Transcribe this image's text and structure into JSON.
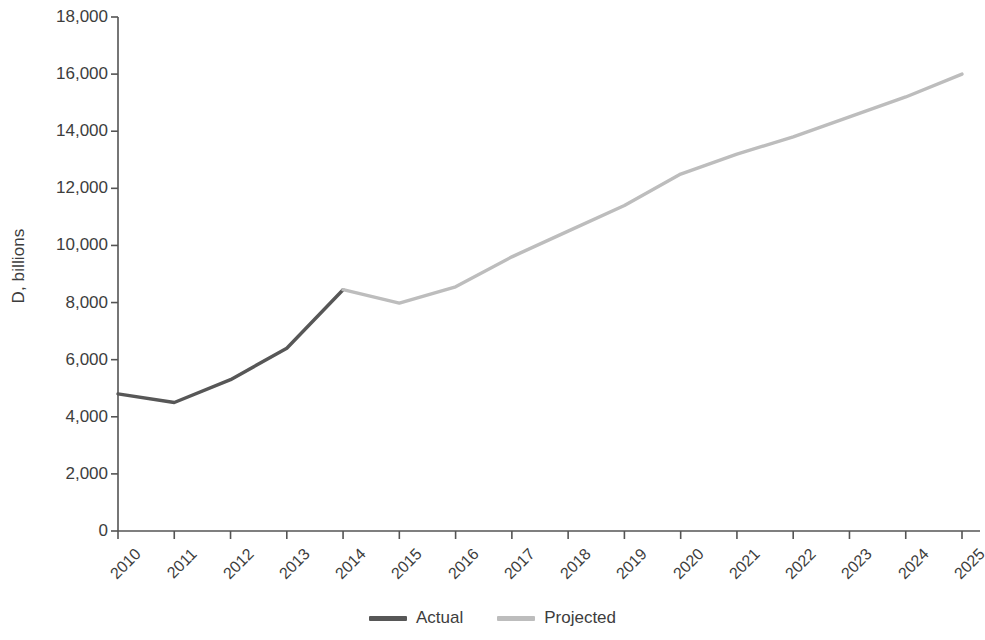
{
  "chart_data": {
    "type": "line",
    "title": "",
    "xlabel": "",
    "ylabel": "D, billions",
    "ylim": [
      0,
      18000
    ],
    "ytick_values": [
      0,
      2000,
      4000,
      6000,
      8000,
      10000,
      12000,
      14000,
      16000,
      18000
    ],
    "ytick_labels": [
      "0",
      "2,000",
      "4,000",
      "6,000",
      "8,000",
      "10,000",
      "12,000",
      "14,000",
      "16,000",
      "18,000"
    ],
    "grid": false,
    "legend_position": "bottom-center",
    "x": [
      2010,
      2011,
      2012,
      2013,
      2014,
      2015,
      2016,
      2017,
      2018,
      2019,
      2020,
      2021,
      2022,
      2023,
      2024,
      2025
    ],
    "categories": [
      "2010",
      "2011",
      "2012",
      "2013",
      "2014",
      "2015",
      "2016",
      "2017",
      "2018",
      "2019",
      "2020",
      "2021",
      "2022",
      "2023",
      "2024",
      "2025"
    ],
    "series": [
      {
        "name": "Actual",
        "color": "#575757",
        "values": [
          4800,
          4500,
          5300,
          6400,
          8450,
          null,
          null,
          null,
          null,
          null,
          null,
          null,
          null,
          null,
          null,
          null
        ]
      },
      {
        "name": "Projected",
        "color": "#bdbdbd",
        "values": [
          null,
          null,
          null,
          null,
          8450,
          7980,
          8550,
          9600,
          10500,
          11400,
          12500,
          13200,
          13800,
          14500,
          15200,
          16000
        ]
      }
    ],
    "axis_color": "#545454"
  },
  "legend": {
    "items": [
      {
        "label": "Actual",
        "color": "#575757"
      },
      {
        "label": "Projected",
        "color": "#bdbdbd"
      }
    ]
  }
}
